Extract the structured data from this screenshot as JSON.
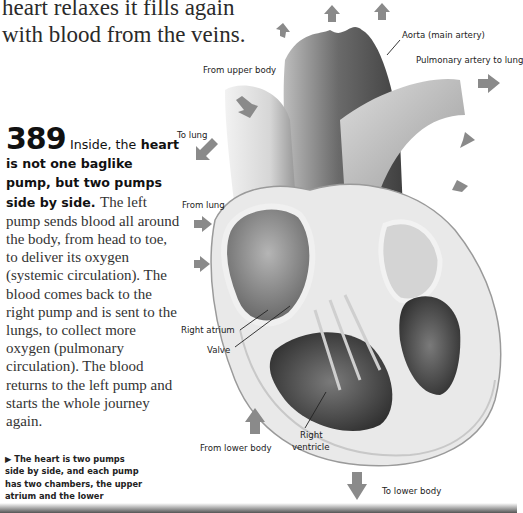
{
  "intro": {
    "line1": "heart relaxes it fills again",
    "line2": "with blood from the veins."
  },
  "fact": {
    "number": "389",
    "lead_part1": "Inside, the",
    "lead_part2": "heart is not one baglike pump, but two pumps side by side.",
    "body": "The left pump sends blood all around the body, from head to toe, to deliver its oxygen (systemic circulation). The blood comes back to the right pump and is sent to the lungs, to collect more oxygen (pulmonary circulation). The blood returns to the left pump and starts the whole journey again."
  },
  "caption": {
    "marker": "▶",
    "text": "The heart is two pumps side by side, and each pump has two chambers, the upper atrium and the lower ventricle."
  },
  "diagram": {
    "labels": {
      "aorta": "Aorta (main artery)",
      "pulmonary_artery": "Pulmonary artery to lung",
      "from_upper_body": "From upper body",
      "to_lung": "To lung",
      "from_lung": "From lung",
      "right_atrium": "Right atrium",
      "valve": "Valve",
      "right_ventricle_1": "Right",
      "right_ventricle_2": "ventricle",
      "from_lower_body": "From lower body",
      "to_lower_body": "To lower body"
    },
    "colors": {
      "arrow": "#8a8a8a",
      "muscle_dark": "#4a4a4a",
      "muscle_light": "#e6e6e6",
      "vessel": "#9a9a9a"
    }
  }
}
